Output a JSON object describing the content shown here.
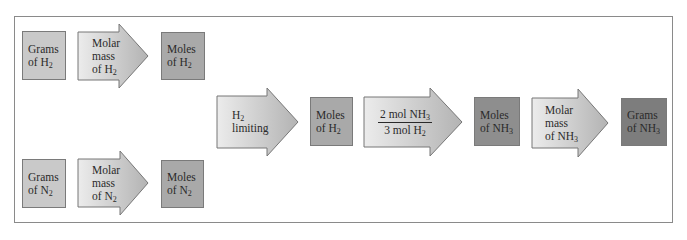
{
  "diagram": {
    "title": "",
    "colors": {
      "frame": "#8a8a8a",
      "box_light": "#c9c9c9",
      "box_mid": "#a9a9a9",
      "box_dark": "#8e8e8e",
      "box_darker": "#7d7d7d",
      "arrow_fill_start": "#ebebeb",
      "arrow_fill_end": "#b5b5b5"
    },
    "top_row": {
      "grams_h2": {
        "line1": "Grams",
        "line2": "of H",
        "sub": "2"
      },
      "molar_mass_h2": {
        "line1": "Molar",
        "line2": "mass",
        "line3": "of H",
        "sub": "2"
      },
      "moles_h2": {
        "line1": "Moles",
        "line2": "of H",
        "sub": "2"
      }
    },
    "bottom_row": {
      "grams_n2": {
        "line1": "Grams",
        "line2": "of N",
        "sub": "2"
      },
      "molar_mass_n2": {
        "line1": "Molar",
        "line2": "mass",
        "line3": "of N",
        "sub": "2"
      },
      "moles_n2": {
        "line1": "Moles",
        "line2": "of N",
        "sub": "2"
      }
    },
    "main_row": {
      "limiting": {
        "line1": "H",
        "sub1": "2",
        "line2": "limiting"
      },
      "moles_h2": {
        "line1": "Moles",
        "line2": "of H",
        "sub": "2"
      },
      "ratio": {
        "num": "2 mol NH",
        "num_sub": "3",
        "den": "3 mol H",
        "den_sub": "2"
      },
      "moles_nh3": {
        "line1": "Moles",
        "line2": "of NH",
        "sub": "3"
      },
      "molar_mass_nh3": {
        "line1": "Molar",
        "line2": "mass",
        "line3": "of NH",
        "sub": "3"
      },
      "grams_nh3": {
        "line1": "Grams",
        "line2": "of NH",
        "sub": "3"
      }
    }
  }
}
